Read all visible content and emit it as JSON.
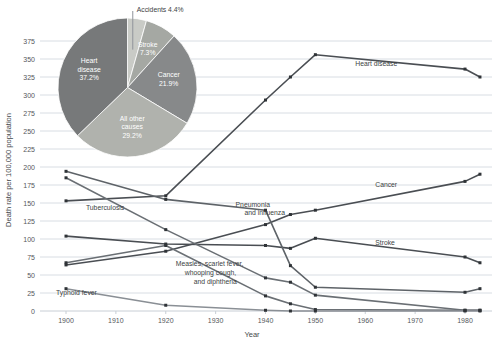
{
  "chart_data": {
    "type": "line",
    "title": "",
    "xlabel": "Year",
    "ylabel": "Death rate per 100,000 population",
    "xlim": [
      1896,
      1986
    ],
    "ylim": [
      0,
      381
    ],
    "grid": true,
    "legend_position": "inline-labels",
    "xticks": [
      1900,
      1910,
      1920,
      1930,
      1940,
      1950,
      1960,
      1970,
      1980
    ],
    "yticks": [
      0,
      25,
      50,
      75,
      100,
      125,
      150,
      175,
      200,
      225,
      250,
      275,
      300,
      325,
      350,
      375
    ],
    "x": [
      1900,
      1920,
      1940,
      1945,
      1950,
      1980,
      1983
    ],
    "series": [
      {
        "name": "Heart disease",
        "label": "Heart disease",
        "color": "#4a4e53",
        "values": [
          153,
          160,
          293,
          325,
          356,
          336,
          325
        ],
        "label_x": 1958,
        "label_y": 340
      },
      {
        "name": "Cancer",
        "label": "Cancer",
        "color": "#4a4e53",
        "values": [
          64,
          83,
          120,
          134,
          140,
          180,
          190
        ],
        "label_x": 1962,
        "label_y": 172
      },
      {
        "name": "Stroke",
        "label": "Stroke",
        "color": "#4a4e53",
        "values": [
          104,
          93,
          91,
          87,
          101,
          75,
          67
        ],
        "label_x": 1962,
        "label_y": 92
      },
      {
        "name": "Pneumonia and influenza",
        "label": "Pneumonia and influenza",
        "color": "#5e6368",
        "values": [
          194,
          155,
          140,
          63,
          33,
          26,
          31
        ],
        "label_x": 1934,
        "label_y": 145
      },
      {
        "name": "Tuberculosis",
        "label": "Tuberculosis",
        "color": "#6a6f74",
        "values": [
          185,
          113,
          46,
          40,
          22,
          1,
          1
        ],
        "label_x": 1904,
        "label_y": 140
      },
      {
        "name": "Measles, scarlet fever, whooping cough, and diphtheria",
        "label": "Measles, scarlet fever, whooping cough, and diphtheria",
        "color": "#6a6f74",
        "values": [
          67,
          91,
          21,
          10,
          2,
          1,
          1
        ],
        "label_x": 1922,
        "label_y": 62
      },
      {
        "name": "Typhoid fever",
        "label": "Typhoid fever",
        "color": "#8a8f95",
        "values": [
          31,
          8,
          1,
          0,
          0,
          0,
          0
        ],
        "label_x": 1898,
        "label_y": 22
      }
    ]
  },
  "pie_chart": {
    "type": "pie",
    "title": "",
    "slices": [
      {
        "label": "Accidents",
        "value": 4.4,
        "label_text": "Accidents 4.4%",
        "color": "#c9cbc6",
        "callout": true
      },
      {
        "label": "Stroke",
        "value": 7.3,
        "label_line1": "Stroke",
        "label_line2": "7.3%",
        "color": "#a5a8a3"
      },
      {
        "label": "Cancer",
        "value": 21.9,
        "label_line1": "Cancer",
        "label_line2": "21.9%",
        "color": "#87898a"
      },
      {
        "label": "All other causes",
        "value": 29.2,
        "label_line1": "All other",
        "label_line2": "causes",
        "label_line3": "29.2%",
        "color": "#b0b2ad"
      },
      {
        "label": "Heart disease",
        "value": 37.2,
        "label_line1": "Heart",
        "label_line2": "disease",
        "label_line3": "37.2%",
        "color": "#77797a"
      }
    ]
  }
}
